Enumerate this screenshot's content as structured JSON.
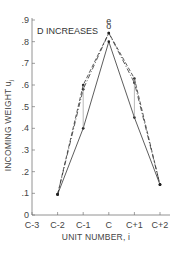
{
  "chart_data": {
    "type": "line",
    "title": "",
    "annotation": "D INCREASES",
    "xlabel": "UNIT NUMBER, i",
    "ylabel": "INCOMING WEIGHT  u",
    "ylabel_sub": "j",
    "categories": [
      "C-3",
      "C-2",
      "C-1",
      "C",
      "C+1",
      "C+2"
    ],
    "yticks": [
      "0",
      ".1",
      ".2",
      ".3",
      ".4",
      ".5",
      ".6",
      ".7",
      ".8",
      ".9"
    ],
    "ylim": [
      0,
      0.9
    ],
    "grid": false,
    "series": [
      {
        "name": "solid",
        "style": "solid",
        "x": [
          "C-2",
          "C-1",
          "C",
          "C+1",
          "C+2"
        ],
        "values": [
          0.095,
          0.4,
          0.8,
          0.45,
          0.14
        ]
      },
      {
        "name": "dashed",
        "style": "dashed",
        "x": [
          "C-2",
          "C-1",
          "C",
          "C+1",
          "C+2"
        ],
        "values": [
          0.095,
          0.6,
          0.84,
          0.63,
          0.14
        ]
      },
      {
        "name": "intermediate",
        "style": "dashdot",
        "x": [
          "C-2",
          "C-1",
          "C",
          "C+1",
          "C+2"
        ],
        "values": [
          0.095,
          0.58,
          0.84,
          0.61,
          0.14
        ]
      }
    ],
    "point_labels": [
      {
        "x": "C",
        "y": 0.89,
        "text": "e"
      },
      {
        "x": "C",
        "y": 0.87,
        "text": "o"
      }
    ]
  }
}
